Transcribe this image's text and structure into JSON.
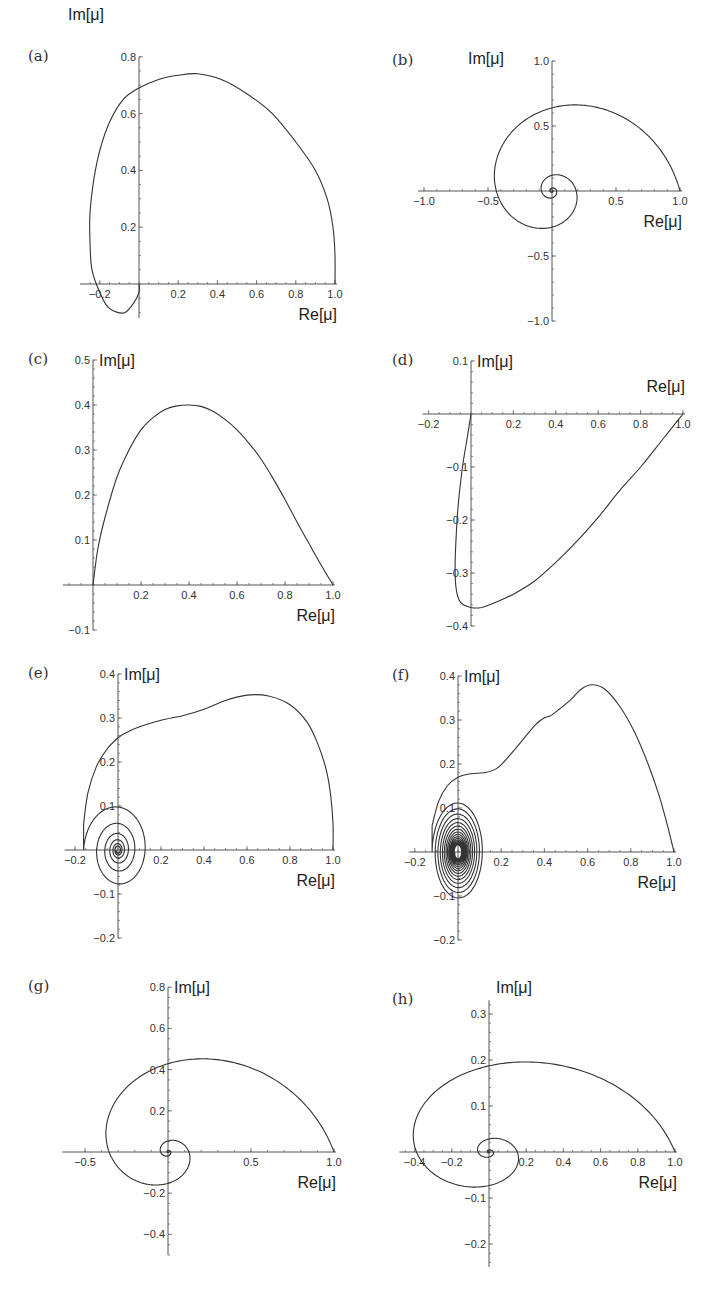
{
  "figure": {
    "panels": [
      "a",
      "b",
      "c",
      "d",
      "e",
      "f",
      "g",
      "h"
    ]
  },
  "chart_data": [
    {
      "id": "a",
      "type": "line",
      "panel_label": "(a)",
      "xlabel": "Re[μ]",
      "ylabel": "Im[μ]",
      "xticks": [
        -0.2,
        0.2,
        0.4,
        0.6,
        0.8,
        1.0
      ],
      "xtick_labels": [
        "−0.2",
        "0.2",
        "0.4",
        "0.6",
        "0.8",
        "1.0"
      ],
      "yticks": [
        0.2,
        0.4,
        0.6,
        0.8
      ],
      "ytick_labels": [
        "0.2",
        "0.4",
        "0.6",
        "0.8"
      ],
      "xlim": [
        -0.27,
        1.0
      ],
      "ylim": [
        -0.12,
        0.8
      ],
      "layout": {
        "ox": 139,
        "oy": 284,
        "sx": 196,
        "sy": 284,
        "xmin": -0.27,
        "xmax": 1.0,
        "ymin": -0.12,
        "ymax": 0.8,
        "title_pos": "left-top",
        "ylab_dx": -118,
        "ylab_dy": -220
      },
      "x": [
        1.0,
        1.0,
        0.99,
        0.96,
        0.9,
        0.8,
        0.68,
        0.55,
        0.42,
        0.3,
        0.2,
        0.1,
        0.0,
        -0.08,
        -0.15,
        -0.2,
        -0.23,
        -0.25,
        -0.25,
        -0.24,
        -0.2,
        -0.16,
        -0.11,
        -0.07,
        -0.03,
        0.0,
        0.0
      ],
      "y": [
        0.0,
        0.1,
        0.2,
        0.3,
        0.4,
        0.5,
        0.6,
        0.67,
        0.72,
        0.74,
        0.735,
        0.72,
        0.69,
        0.65,
        0.57,
        0.47,
        0.37,
        0.25,
        0.15,
        0.05,
        -0.03,
        -0.08,
        -0.1,
        -0.1,
        -0.07,
        -0.03,
        0.0
      ]
    },
    {
      "id": "b",
      "type": "line",
      "panel_label": "(b)",
      "xlabel": "Re[μ]",
      "ylabel": "Im[μ]",
      "xticks": [
        -1.0,
        -0.5,
        0.5,
        1.0
      ],
      "xtick_labels": [
        "−1.0",
        "−0.5",
        "0.5",
        "1.0"
      ],
      "yticks": [
        -1.0,
        -0.5,
        0.5,
        1.0
      ],
      "ytick_labels": [
        "−1.0",
        "−0.5",
        "0.5",
        "1.0"
      ],
      "xlim": [
        -1.0,
        1.0
      ],
      "ylim": [
        -1.0,
        1.0
      ],
      "layout": {
        "ox": 552,
        "oy": 191,
        "sx": 128,
        "sy": 130,
        "xmin": -1.0,
        "xmax": 1.0,
        "ymin": -1.0,
        "ymax": 1.0
      },
      "spiral": {
        "r0": 1.0,
        "decay": 0.265,
        "turns": 3.2
      }
    },
    {
      "id": "c",
      "type": "line",
      "panel_label": "(c)",
      "xlabel": "Re[μ]",
      "ylabel": "Im[μ]",
      "xticks": [
        0.2,
        0.4,
        0.6,
        0.8,
        1.0
      ],
      "xtick_labels": [
        "0.2",
        "0.4",
        "0.6",
        "0.8",
        "1.0"
      ],
      "yticks": [
        -0.1,
        0.1,
        0.2,
        0.3,
        0.4,
        0.5
      ],
      "ytick_labels": [
        "−0.1",
        "0.1",
        "0.2",
        "0.3",
        "0.4",
        "0.5"
      ],
      "xlim": [
        -0.1,
        1.0
      ],
      "ylim": [
        -0.1,
        0.5
      ],
      "layout": {
        "ox": 93,
        "oy": 585,
        "sx": 240,
        "sy": 450,
        "xmin": -0.1,
        "xmax": 1.0,
        "ymin": -0.1,
        "ymax": 0.5
      },
      "x": [
        0.0,
        0.02,
        0.05,
        0.1,
        0.15,
        0.2,
        0.25,
        0.3,
        0.35,
        0.4,
        0.45,
        0.5,
        0.55,
        0.6,
        0.65,
        0.7,
        0.75,
        0.8,
        0.85,
        0.9,
        0.95,
        1.0
      ],
      "y": [
        0.0,
        0.08,
        0.15,
        0.24,
        0.3,
        0.345,
        0.372,
        0.39,
        0.398,
        0.4,
        0.397,
        0.386,
        0.368,
        0.345,
        0.315,
        0.28,
        0.237,
        0.19,
        0.14,
        0.092,
        0.045,
        0.0
      ]
    },
    {
      "id": "d",
      "type": "line",
      "panel_label": "(d)",
      "xlabel": "Re[μ]",
      "ylabel": "Im[μ]",
      "xticks": [
        -0.2,
        0.2,
        0.4,
        0.6,
        0.8,
        1.0
      ],
      "xtick_labels": [
        "−0.2",
        "0.2",
        "0.4",
        "0.6",
        "0.8",
        "1.0"
      ],
      "yticks": [
        -0.4,
        -0.3,
        -0.2,
        -0.1,
        0.1
      ],
      "ytick_labels": [
        "−0.4",
        "−0.3",
        "−0.2",
        "−0.1",
        "0.1"
      ],
      "xlim": [
        -0.2,
        1.0
      ],
      "ylim": [
        -0.4,
        0.1
      ],
      "layout": {
        "ox": 471,
        "oy": 414,
        "sx": 212,
        "sy": 530,
        "xmin": -0.2,
        "xmax": 1.0,
        "ymin": -0.4,
        "ymax": 0.1
      },
      "x": [
        0.0,
        -0.02,
        -0.04,
        -0.06,
        -0.07,
        -0.075,
        -0.07,
        -0.05,
        0.0,
        0.05,
        0.12,
        0.2,
        0.3,
        0.4,
        0.5,
        0.6,
        0.7,
        0.8,
        0.9,
        0.97,
        1.0
      ],
      "y": [
        0.0,
        -0.05,
        -0.1,
        -0.17,
        -0.23,
        -0.29,
        -0.33,
        -0.355,
        -0.365,
        -0.365,
        -0.355,
        -0.34,
        -0.315,
        -0.28,
        -0.24,
        -0.195,
        -0.145,
        -0.1,
        -0.05,
        -0.015,
        0.0
      ]
    },
    {
      "id": "e",
      "type": "line",
      "panel_label": "(e)",
      "xlabel": "Re[μ]",
      "ylabel": "Im[μ]",
      "xticks": [
        -0.2,
        0.2,
        0.4,
        0.6,
        0.8,
        1.0
      ],
      "xtick_labels": [
        "−0.2",
        "0.2",
        "0.4",
        "0.6",
        "0.8",
        "1.0"
      ],
      "yticks": [
        -0.2,
        -0.1,
        0.1,
        0.2,
        0.3,
        0.4
      ],
      "ytick_labels": [
        "−0.2",
        "−0.1",
        "0.1",
        "0.2",
        "0.3",
        "0.4"
      ],
      "xlim": [
        -0.2,
        1.0
      ],
      "ylim": [
        -0.2,
        0.4
      ],
      "layout": {
        "ox": 118,
        "oy": 850,
        "sx": 215,
        "sy": 440,
        "xmin": -0.22,
        "xmax": 1.0,
        "ymin": -0.2,
        "ymax": 0.4
      },
      "x": [
        1.0,
        1.0,
        0.99,
        0.97,
        0.93,
        0.88,
        0.8,
        0.7,
        0.6,
        0.5,
        0.4,
        0.3,
        0.2,
        0.1,
        0.03,
        0.0,
        -0.05,
        -0.1,
        -0.14,
        -0.16
      ],
      "y": [
        0.0,
        0.06,
        0.12,
        0.18,
        0.24,
        0.29,
        0.33,
        0.35,
        0.352,
        0.34,
        0.32,
        0.305,
        0.295,
        0.28,
        0.265,
        0.255,
        0.23,
        0.19,
        0.13,
        0.06
      ],
      "inner_spiral": {
        "cx": 0.0,
        "cy": 0.0,
        "r0x": 0.16,
        "r0y": 0.11,
        "decay": 0.62,
        "turns": 6
      }
    },
    {
      "id": "f",
      "type": "line",
      "panel_label": "(f)",
      "xlabel": "Re[μ]",
      "ylabel": "Im[μ]",
      "xticks": [
        -0.2,
        0.2,
        0.4,
        0.6,
        0.8,
        1.0
      ],
      "xtick_labels": [
        "−0.2",
        "0.2",
        "0.4",
        "0.6",
        "0.8",
        "1.0"
      ],
      "yticks": [
        -0.2,
        -0.1,
        0.1,
        0.2,
        0.3,
        0.4
      ],
      "ytick_labels": [
        "−0.2",
        "−0.1",
        "0.1",
        "0.2",
        "0.3",
        "0.4"
      ],
      "xlim": [
        -0.2,
        1.0
      ],
      "ylim": [
        -0.2,
        0.4
      ],
      "layout": {
        "ox": 458,
        "oy": 852,
        "sx": 216,
        "sy": 440,
        "xmin": -0.2,
        "xmax": 1.0,
        "ymin": -0.2,
        "ymax": 0.4
      },
      "x": [
        1.0,
        0.97,
        0.93,
        0.88,
        0.82,
        0.75,
        0.68,
        0.62,
        0.57,
        0.52,
        0.47,
        0.43,
        0.4,
        0.36,
        0.3,
        0.24,
        0.18,
        0.12,
        0.06,
        0.0,
        -0.05,
        -0.09,
        -0.12
      ],
      "y": [
        0.0,
        0.06,
        0.13,
        0.2,
        0.27,
        0.33,
        0.37,
        0.38,
        0.37,
        0.345,
        0.325,
        0.31,
        0.305,
        0.29,
        0.255,
        0.22,
        0.19,
        0.18,
        0.178,
        0.17,
        0.15,
        0.115,
        0.06
      ],
      "inner_spiral": {
        "cx": 0.0,
        "cy": 0.0,
        "r0x": 0.12,
        "r0y": 0.115,
        "decay": 0.88,
        "turns": 16
      }
    },
    {
      "id": "g",
      "type": "line",
      "panel_label": "(g)",
      "xlabel": "Re[μ]",
      "ylabel": "Im[μ]",
      "xticks": [
        -0.5,
        0.5,
        1.0
      ],
      "xtick_labels": [
        "−0.5",
        "0.5",
        "1.0"
      ],
      "yticks": [
        -0.4,
        -0.2,
        0.2,
        0.4,
        0.6,
        0.8
      ],
      "ytick_labels": [
        "−0.4",
        "−0.2",
        "0.2",
        "0.4",
        "0.6",
        "0.8"
      ],
      "xlim": [
        -0.6,
        1.0
      ],
      "ylim": [
        -0.5,
        0.8
      ],
      "layout": {
        "ox": 168,
        "oy": 1152,
        "sx": 166,
        "sy": 206,
        "xmin": -0.6,
        "xmax": 1.0,
        "ymin": -0.5,
        "ymax": 0.8
      },
      "spiral": {
        "r0": 1.0,
        "decay": 0.33,
        "turns": 3.0,
        "yscale": 0.72
      }
    },
    {
      "id": "h",
      "type": "line",
      "panel_label": "(h)",
      "xlabel": "Re[μ]",
      "ylabel": "Im[μ]",
      "xticks": [
        -0.4,
        -0.2,
        0.2,
        0.4,
        0.6,
        0.8,
        1.0
      ],
      "xtick_labels": [
        "−0.4",
        "−0.2",
        "0.2",
        "0.4",
        "0.6",
        "0.8",
        "1.0"
      ],
      "yticks": [
        -0.2,
        -0.1,
        0.1,
        0.2,
        0.3
      ],
      "ytick_labels": [
        "−0.2",
        "−0.1",
        "0.1",
        "0.2",
        "0.3"
      ],
      "xlim": [
        -0.45,
        1.0
      ],
      "ylim": [
        -0.25,
        0.33
      ],
      "layout": {
        "ox": 489,
        "oy": 1152,
        "sx": 186,
        "sy": 460,
        "xmin": -0.45,
        "xmax": 1.0,
        "ymin": -0.25,
        "ymax": 0.33
      },
      "spiral": {
        "r0": 1.0,
        "decay": 0.3,
        "turns": 4.0,
        "yscale": 0.3
      }
    }
  ]
}
